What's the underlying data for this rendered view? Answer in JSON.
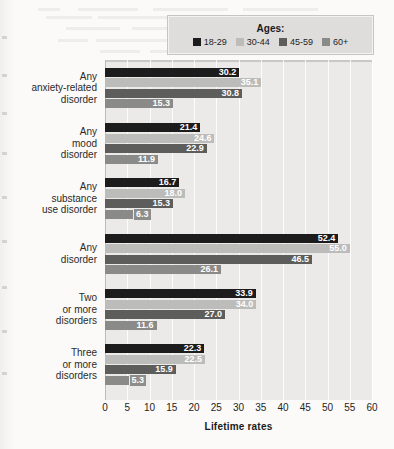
{
  "legend": {
    "title": "Ages:",
    "items": [
      {
        "label": "18-29",
        "color": "#1c1c1c"
      },
      {
        "label": "30-44",
        "color": "#bcbcba"
      },
      {
        "label": "45-59",
        "color": "#5d5d5b"
      },
      {
        "label": "60+",
        "color": "#8a8a88"
      }
    ]
  },
  "axis": {
    "title": "Lifetime rates",
    "ticks": [
      "0",
      "5",
      "10",
      "15",
      "20",
      "25",
      "30",
      "35",
      "40",
      "45",
      "50",
      "55",
      "60"
    ]
  },
  "chart_data": {
    "type": "bar",
    "orientation": "horizontal",
    "title": "",
    "xlabel": "Lifetime rates",
    "ylabel": "",
    "xlim": [
      0,
      60
    ],
    "xticks": [
      0,
      5,
      10,
      15,
      20,
      25,
      30,
      35,
      40,
      45,
      50,
      55,
      60
    ],
    "grid": true,
    "legend_title": "Ages:",
    "legend_position": "top-right",
    "categories": [
      "Any anxiety-related disorder",
      "Any mood disorder",
      "Any substance use disorder",
      "Any disorder",
      "Two or more disorders",
      "Three or more disorders"
    ],
    "category_lines": [
      [
        "Any",
        "anxiety-related",
        "disorder"
      ],
      [
        "Any",
        "mood",
        "disorder"
      ],
      [
        "Any",
        "substance",
        "use disorder"
      ],
      [
        "Any",
        "disorder"
      ],
      [
        "Two",
        "or more",
        "disorders"
      ],
      [
        "Three",
        "or more",
        "disorders"
      ]
    ],
    "series": [
      {
        "name": "18-29",
        "color": "#1c1c1c",
        "values": [
          30.2,
          21.4,
          16.7,
          52.4,
          33.9,
          22.3
        ]
      },
      {
        "name": "30-44",
        "color": "#bcbcba",
        "values": [
          35.1,
          24.6,
          18.0,
          55.0,
          34.0,
          22.5
        ]
      },
      {
        "name": "45-59",
        "color": "#5d5d5b",
        "values": [
          30.8,
          22.9,
          15.3,
          46.5,
          27.0,
          15.9
        ]
      },
      {
        "name": "60+",
        "color": "#8a8a88",
        "values": [
          15.3,
          11.9,
          6.3,
          26.1,
          11.6,
          5.3
        ]
      }
    ]
  }
}
